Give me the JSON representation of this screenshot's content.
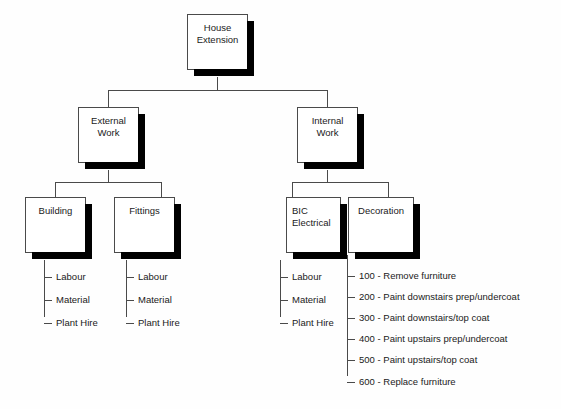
{
  "diagram": {
    "type": "work-breakdown-structure",
    "colors": {
      "background": "#fefefe",
      "box_fill": "#ffffff",
      "box_border": "#4a4a4a",
      "shadow": "#000000",
      "text": "#1a1a1a",
      "connector": "#4a4a4a"
    },
    "nodes": {
      "root": {
        "label": "House\nExtension",
        "level": 0
      },
      "external_work": {
        "label": "External\nWork",
        "level": 1
      },
      "internal_work": {
        "label": "Internal\nWork",
        "level": 1
      },
      "building": {
        "label": "Building",
        "level": 2
      },
      "fittings": {
        "label": "Fittings",
        "level": 2
      },
      "bic_electrical": {
        "label": "BIC\nElectrical",
        "level": 2,
        "align": "left"
      },
      "decoration": {
        "label": "Decoration",
        "level": 2
      }
    },
    "leaves": {
      "building": [
        "Labour",
        "Material",
        "Plant Hire"
      ],
      "fittings": [
        "Labour",
        "Material",
        "Plant Hire"
      ],
      "bic_electrical": [
        "Labour",
        "Material",
        "Plant Hire"
      ],
      "decoration": [
        "100 - Remove furniture",
        "200 - Paint downstairs prep/undercoat",
        "300 - Paint downstairs/top coat",
        "400 - Paint upstairs prep/undercoat",
        "500 - Paint upstairs/top coat",
        "600 - Replace furniture"
      ]
    }
  }
}
